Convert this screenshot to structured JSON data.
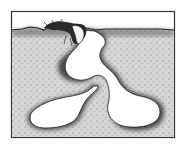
{
  "figure": {
    "alt": "Stippled illustration of an insect at the ground surface above a burrow that descends to a chamber and branches into two large lower chambers",
    "colors": {
      "background": "#ffffff",
      "soil": "#d6d6d6",
      "stipple": "#3a3a3a",
      "outline": "#222222",
      "chamber": "#ffffff",
      "sky": "#ffffff"
    },
    "elements": {
      "insect": "insect-at-entrance",
      "burrow": "entrance-tunnel",
      "upper_chamber": "upper-chamber",
      "left_chamber": "lower-left-chamber",
      "right_chamber": "lower-right-chamber"
    }
  }
}
